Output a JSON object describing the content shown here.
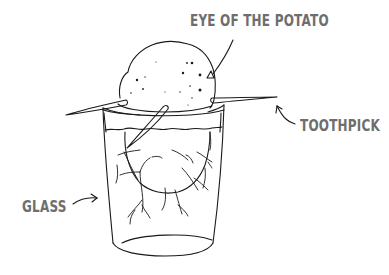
{
  "diagram": {
    "labels": {
      "eye": "EYE OF THE POTATO",
      "toothpick": "TOOTHPICK",
      "glass": "GLASS"
    },
    "colors": {
      "ink": "#1a1a1a",
      "label_text": "#6e6e6e",
      "background": "#ffffff"
    }
  }
}
